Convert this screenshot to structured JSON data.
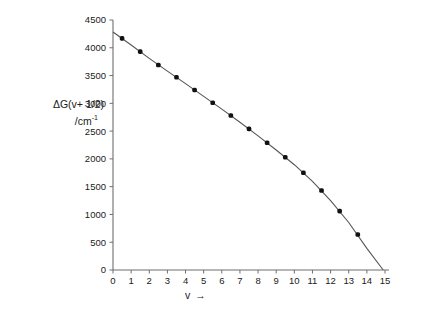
{
  "figure": {
    "background_color": "#ffffff",
    "axis_color": "#6e6e6e",
    "line_color": "#555555",
    "marker_color": "#111111"
  },
  "axis_labels": {
    "y_line1": "ΔG(v+ 1/2)",
    "y_line2_prefix": "/cm",
    "y_line2_exponent": "-1",
    "x_symbol": "v",
    "x_arrow": "→"
  },
  "chart_data": {
    "type": "scatter",
    "title": "",
    "subtitle": "",
    "xlabel": "v →",
    "ylabel": "ΔG(v+ 1/2) /cm⁻¹",
    "xlim": [
      0,
      15
    ],
    "ylim": [
      0,
      4500
    ],
    "grid": false,
    "legend": null,
    "xticks": [
      0,
      1,
      2,
      3,
      4,
      5,
      6,
      7,
      8,
      9,
      10,
      11,
      12,
      13,
      14,
      15
    ],
    "xtick_labels": [
      "0",
      "1",
      "2",
      "3",
      "4",
      "5",
      "6",
      "7",
      "8",
      "9",
      "10",
      "11",
      "12",
      "13",
      "14",
      "15"
    ],
    "yticks": [
      0,
      500,
      1000,
      1500,
      2000,
      2500,
      3000,
      3500,
      4000,
      4500
    ],
    "ytick_labels": [
      "0",
      "500",
      "1000",
      "1500",
      "2000",
      "2500",
      "3000",
      "3500",
      "4000",
      "4500"
    ],
    "x": [
      0.5,
      1.5,
      2.5,
      3.5,
      4.5,
      5.5,
      6.5,
      7.5,
      8.5,
      9.5,
      10.5,
      11.5,
      12.5,
      13.5
    ],
    "values": [
      4170,
      3930,
      3690,
      3470,
      3240,
      3010,
      2780,
      2540,
      2290,
      2030,
      1750,
      1430,
      1060,
      640
    ],
    "fit_curve": {
      "description": "smooth birge-sponer extrapolation through points",
      "x": [
        0.0,
        1.0,
        2.0,
        3.0,
        4.0,
        5.0,
        6.0,
        7.0,
        8.0,
        9.0,
        10.0,
        11.0,
        12.0,
        13.0,
        14.0,
        14.9
      ],
      "y": [
        4285,
        4050,
        3810,
        3580,
        3355,
        3125,
        2895,
        2660,
        2415,
        2160,
        1895,
        1595,
        1250,
        855,
        390,
        0
      ]
    },
    "x_intercept": 14.9,
    "y_intercept": 4285
  }
}
